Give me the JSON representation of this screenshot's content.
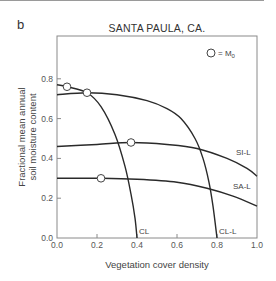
{
  "panel_label": "b",
  "chart_data": {
    "type": "line",
    "title": "SANTA PAULA, CA.",
    "xlabel": "Vegetation cover density",
    "ylabel_line1": "Fractional mean annual",
    "ylabel_line2": "soil moisture content",
    "xlim": [
      0.0,
      1.0
    ],
    "ylim": [
      0.0,
      1.02
    ],
    "x_ticks": [
      "0.0",
      "0.2",
      "0.4",
      "0.6",
      "0.8",
      "1.0"
    ],
    "y_ticks": [
      "0.0",
      "0.2",
      "0.4",
      "0.6",
      "0.8"
    ],
    "grid": false,
    "legend": {
      "symbol": "open-circle",
      "text": "= M",
      "subscript": "0",
      "position": "top-right"
    },
    "series": [
      {
        "name": "CL",
        "points": [
          [
            0.0,
            0.77
          ],
          [
            0.05,
            0.76
          ],
          [
            0.15,
            0.73
          ],
          [
            0.22,
            0.66
          ],
          [
            0.29,
            0.52
          ],
          [
            0.34,
            0.36
          ],
          [
            0.37,
            0.22
          ],
          [
            0.39,
            0.1
          ],
          [
            0.4,
            0.0
          ]
        ],
        "marker": [
          0.05,
          0.76
        ]
      },
      {
        "name": "CL-L",
        "points": [
          [
            0.0,
            0.72
          ],
          [
            0.15,
            0.73
          ],
          [
            0.3,
            0.72
          ],
          [
            0.45,
            0.69
          ],
          [
            0.55,
            0.65
          ],
          [
            0.62,
            0.6
          ],
          [
            0.69,
            0.5
          ],
          [
            0.73,
            0.4
          ],
          [
            0.76,
            0.28
          ],
          [
            0.78,
            0.16
          ],
          [
            0.8,
            0.0
          ]
        ],
        "marker": [
          0.15,
          0.73
        ]
      },
      {
        "name": "SI-L",
        "points": [
          [
            0.0,
            0.46
          ],
          [
            0.2,
            0.47
          ],
          [
            0.37,
            0.48
          ],
          [
            0.55,
            0.47
          ],
          [
            0.7,
            0.45
          ],
          [
            0.85,
            0.4
          ],
          [
            0.95,
            0.35
          ],
          [
            1.0,
            0.31
          ]
        ],
        "marker": [
          0.37,
          0.48
        ]
      },
      {
        "name": "SA-L",
        "points": [
          [
            0.0,
            0.3
          ],
          [
            0.22,
            0.3
          ],
          [
            0.4,
            0.295
          ],
          [
            0.6,
            0.28
          ],
          [
            0.75,
            0.25
          ],
          [
            0.88,
            0.21
          ],
          [
            1.0,
            0.16
          ]
        ],
        "marker": [
          0.22,
          0.3
        ]
      }
    ]
  }
}
